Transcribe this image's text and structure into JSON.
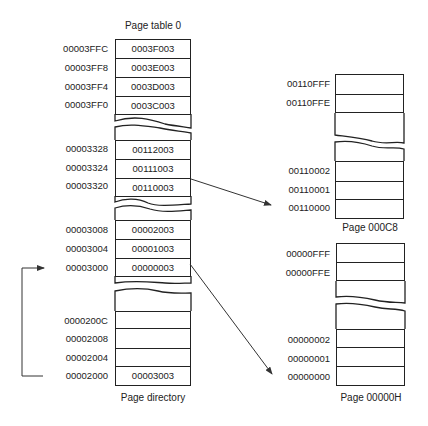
{
  "page_table_0": {
    "title": "Page table 0",
    "caption": "Page directory",
    "rows": [
      {
        "address": "00003FFC",
        "value": "0003F003"
      },
      {
        "address": "00003FF8",
        "value": "0003E003"
      },
      {
        "address": "00003FF4",
        "value": "0003D003"
      },
      {
        "address": "00003FF0",
        "value": "0003C003"
      },
      {
        "address": "00003328",
        "value": "00112003"
      },
      {
        "address": "00003324",
        "value": "00111003"
      },
      {
        "address": "00003320",
        "value": "00110003"
      },
      {
        "address": "00003008",
        "value": "00002003"
      },
      {
        "address": "00003004",
        "value": "00001003"
      },
      {
        "address": "00003000",
        "value": "00000003"
      },
      {
        "address": "0000200C",
        "value": ""
      },
      {
        "address": "00002008",
        "value": ""
      },
      {
        "address": "00002004",
        "value": ""
      },
      {
        "address": "00002000",
        "value": "00003003"
      }
    ]
  },
  "page_000C8": {
    "caption": "Page 000C8",
    "rows": [
      {
        "address": "00110FFF"
      },
      {
        "address": "00110FFE"
      },
      {
        "address": "00110002"
      },
      {
        "address": "00110001"
      },
      {
        "address": "00110000"
      }
    ]
  },
  "page_00000H": {
    "caption": "Page 00000H",
    "rows": [
      {
        "address": "00000FFF"
      },
      {
        "address": "00000FFE"
      },
      {
        "address": "00000002"
      },
      {
        "address": "00000001"
      },
      {
        "address": "00000000"
      }
    ]
  },
  "arrows": [
    {
      "from": "00003320 entry (00110003)",
      "to": "Page 000C8 address 00110000"
    },
    {
      "from": "00003000 entry (00000003)",
      "to": "Page 00000H address 00000000"
    },
    {
      "from": "00002000 entry (00003003)",
      "to": "00003000 (Page table 0 start)"
    }
  ]
}
